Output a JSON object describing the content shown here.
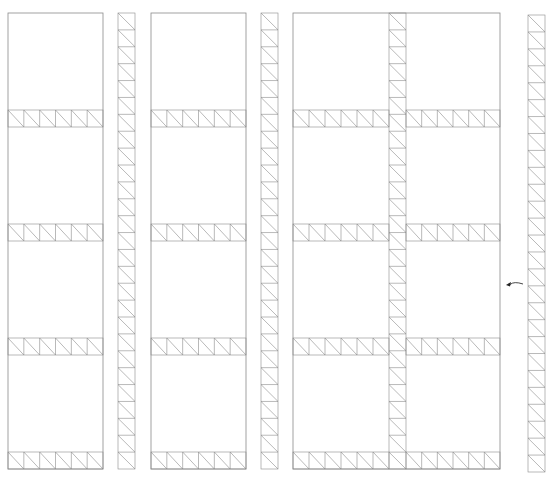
{
  "diagram": {
    "title": "",
    "width": 559,
    "height": 481,
    "line_color": "#8a8a8a",
    "arrow_color": "#222222",
    "panel_groups": [
      {
        "name": "panel-column-1",
        "x": 8,
        "w": 95,
        "top": 13,
        "bottom": 469,
        "cols": 1
      },
      {
        "name": "panel-column-2",
        "x": 151,
        "w": 95,
        "top": 13,
        "bottom": 469,
        "cols": 1
      },
      {
        "name": "panel-column-3-double",
        "x": 293,
        "w": 207,
        "top": 13,
        "bottom": 469,
        "cols": 2,
        "inner_truss_x": 389,
        "inner_truss_w": 17
      }
    ],
    "horizontal_truss_rows": [
      {
        "y": 110,
        "h": 17
      },
      {
        "y": 224,
        "h": 17
      },
      {
        "y": 338,
        "h": 17
      },
      {
        "y": 452,
        "h": 17
      }
    ],
    "vertical_trusses": [
      {
        "name": "vertical-truss-1",
        "x": 118,
        "w": 17,
        "top": 13,
        "bottom": 469
      },
      {
        "name": "vertical-truss-2",
        "x": 261,
        "w": 17,
        "top": 13,
        "bottom": 469
      },
      {
        "name": "vertical-truss-3",
        "x": 528,
        "w": 17,
        "top": 15,
        "bottom": 472
      }
    ],
    "truss_cell_size": 17,
    "arrow": {
      "label": "",
      "tip": [
        506,
        285
      ],
      "tail": [
        523,
        284
      ],
      "control": [
        514,
        281
      ],
      "direction": "left"
    }
  }
}
